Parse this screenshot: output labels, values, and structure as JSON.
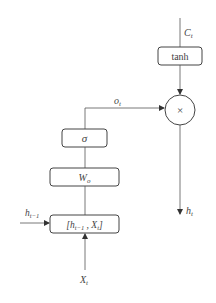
{
  "diagram": {
    "inputs": {
      "cell_state": "C",
      "cell_state_sub": "t",
      "prev_hidden": "h",
      "prev_hidden_sub": "t−1",
      "input": "X",
      "input_sub": "t"
    },
    "nodes": {
      "tanh": "tanh",
      "sigma": "σ",
      "weight": "W",
      "weight_sub": "o",
      "concat_open": "[h",
      "concat_sub1": "t−1",
      "concat_mid": " ,  X",
      "concat_sub2": "t",
      "concat_close": "]",
      "multiply": "×"
    },
    "edges": {
      "gate_output": "o",
      "gate_output_sub": "t"
    },
    "outputs": {
      "hidden": "h",
      "hidden_sub": "t"
    },
    "colors": {
      "stroke": "#444444",
      "background": "#ffffff"
    }
  }
}
